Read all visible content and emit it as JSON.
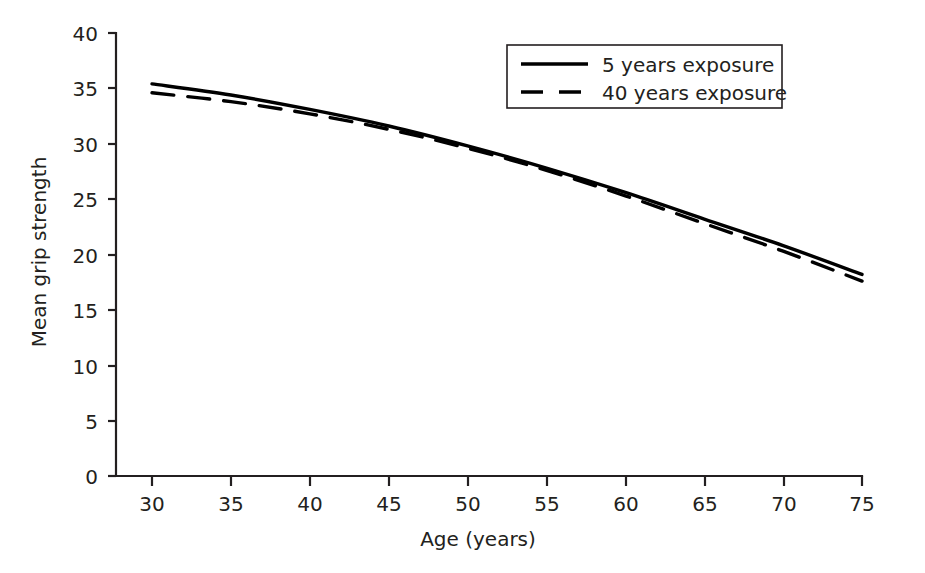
{
  "chart_data": {
    "type": "line",
    "title": "",
    "xlabel": "Age (years)",
    "ylabel": "Mean grip strength",
    "xlim": [
      30,
      75
    ],
    "ylim": [
      0,
      40
    ],
    "xticks": [
      30,
      35,
      40,
      45,
      50,
      55,
      60,
      65,
      70,
      75
    ],
    "yticks": [
      0,
      5,
      10,
      15,
      20,
      25,
      30,
      35,
      40
    ],
    "xtick_labels": [
      "30",
      "35",
      "40",
      "45",
      "50",
      "55",
      "60",
      "65",
      "70",
      "75"
    ],
    "ytick_labels": [
      "0",
      "5",
      "10",
      "15",
      "20",
      "25",
      "30",
      "35",
      "40"
    ],
    "grid": false,
    "legend_position": "top-right",
    "x": [
      30,
      35,
      40,
      45,
      50,
      55,
      60,
      65,
      70,
      75
    ],
    "series": [
      {
        "name": "5 years exposure",
        "style": "solid",
        "color": "#000000",
        "values": [
          35.4,
          34.4,
          33.1,
          31.6,
          29.8,
          27.8,
          25.6,
          23.2,
          20.8,
          18.2
        ]
      },
      {
        "name": "40 years exposure",
        "style": "dashed",
        "color": "#000000",
        "values": [
          34.6,
          33.8,
          32.7,
          31.3,
          29.6,
          27.6,
          25.3,
          22.8,
          20.3,
          17.6
        ]
      }
    ]
  },
  "legend": {
    "entries": [
      {
        "label": "5 years exposure",
        "style": "solid"
      },
      {
        "label": "40 years exposure",
        "style": "dashed"
      }
    ]
  },
  "axes": {
    "x_title": "Age (years)",
    "y_title": "Mean grip strength"
  }
}
